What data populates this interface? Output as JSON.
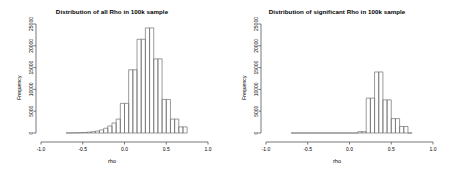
{
  "figure": {
    "background": "#ffffff",
    "axis_color": "#555555",
    "bar_stroke": "#6e6e6e",
    "panels": 2
  },
  "chart_data": [
    {
      "type": "bar",
      "panel": "left",
      "title": "Distribution of all Rho in 100k sample",
      "xlabel": "rho",
      "ylabel": "Frequency",
      "xlim": [
        -1.0,
        1.0
      ],
      "ylim": [
        0,
        25000
      ],
      "xticks": [
        -1.0,
        -0.5,
        0.0,
        0.5,
        1.0
      ],
      "xtick_labels": [
        "-1.0",
        "-0.5",
        "0.0",
        "0.5",
        "1.0"
      ],
      "yticks": [
        0,
        5000,
        10000,
        15000,
        20000,
        25000
      ],
      "ytick_labels": [
        "0",
        "5000",
        "10000",
        "15000",
        "20000",
        "25000"
      ],
      "grid": false,
      "legend": "none",
      "bin_width": 0.05,
      "bin_edges": [
        -0.7,
        -0.65,
        -0.6,
        -0.55,
        -0.5,
        -0.45,
        -0.4,
        -0.35,
        -0.3,
        -0.25,
        -0.2,
        -0.15,
        -0.1,
        -0.05,
        0.0,
        0.05,
        0.1,
        0.15,
        0.2,
        0.25,
        0.3,
        0.35,
        0.4,
        0.45,
        0.5,
        0.55,
        0.6,
        0.65,
        0.7,
        0.75
      ],
      "values": [
        20,
        30,
        50,
        80,
        120,
        200,
        300,
        450,
        700,
        1100,
        1600,
        2300,
        3200,
        6800,
        6800,
        14500,
        14500,
        21500,
        21500,
        24100,
        24100,
        17000,
        17000,
        7700,
        7700,
        3200,
        3200,
        1400,
        1400
      ]
    },
    {
      "type": "bar",
      "panel": "right",
      "title": "Distribution of significant Rho in 100k sample",
      "xlabel": "rho",
      "ylabel": "Frequency",
      "xlim": [
        -1.0,
        1.0
      ],
      "ylim": [
        0,
        25000
      ],
      "xticks": [
        -1.0,
        -0.5,
        0.0,
        0.5,
        1.0
      ],
      "xtick_labels": [
        "-1.0",
        "-0.5",
        "0.0",
        "0.5",
        "1.0"
      ],
      "yticks": [
        0,
        5000,
        10000,
        15000,
        20000,
        25000
      ],
      "ytick_labels": [
        "0",
        "5000",
        "10000",
        "15000",
        "20000",
        "25000"
      ],
      "grid": false,
      "legend": "none",
      "bin_width": 0.05,
      "bin_edges": [
        -0.7,
        -0.65,
        -0.6,
        -0.55,
        -0.5,
        -0.45,
        -0.4,
        -0.35,
        -0.3,
        -0.25,
        -0.2,
        -0.15,
        -0.1,
        -0.05,
        0.0,
        0.05,
        0.1,
        0.15,
        0.2,
        0.25,
        0.3,
        0.35,
        0.4,
        0.45,
        0.5,
        0.55,
        0.6,
        0.65,
        0.7,
        0.75
      ],
      "values": [
        0,
        0,
        0,
        0,
        0,
        0,
        0,
        0,
        0,
        0,
        0,
        0,
        0,
        0,
        0,
        0,
        300,
        300,
        8000,
        8000,
        14000,
        14000,
        7600,
        7600,
        3300,
        3300,
        1500,
        1500,
        0
      ]
    }
  ]
}
